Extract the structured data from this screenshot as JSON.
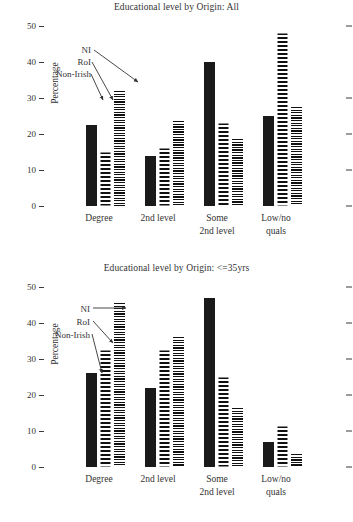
{
  "chart_data": [
    {
      "type": "bar",
      "title": "Educational level by Origin: All",
      "xlabel": "",
      "ylabel": "Percentage",
      "ylim": [
        0,
        50
      ],
      "yticks": [
        0,
        10,
        20,
        30,
        40,
        50
      ],
      "grid": false,
      "legend_position": "annotated-arrows",
      "categories": [
        "Degree",
        "2nd level",
        "Some\n2nd level",
        "Low/no\nquals"
      ],
      "category_lines": [
        [
          "Degree"
        ],
        [
          "2nd level"
        ],
        [
          "Some",
          "2nd level"
        ],
        [
          "Low/no",
          "quals"
        ]
      ],
      "series": [
        {
          "name": "NI",
          "pattern": "solid-black",
          "values": [
            22.5,
            14.0,
            40.0,
            25.0
          ]
        },
        {
          "name": "RoI",
          "pattern": "coarse-horizontal-stripes",
          "values": [
            15.0,
            16.0,
            23.0,
            48.0
          ]
        },
        {
          "name": "Non-Irish",
          "pattern": "fine-horizontal-stripes",
          "values": [
            32.0,
            23.5,
            18.5,
            27.5
          ]
        }
      ],
      "annotations": [
        {
          "label": "NI",
          "points_to_series": "NI"
        },
        {
          "label": "RoI",
          "points_to_series": "RoI"
        },
        {
          "label": "Non-Irish",
          "points_to_series": "Non-Irish"
        }
      ]
    },
    {
      "type": "bar",
      "title": "Educational level by Origin: <=35yrs",
      "xlabel": "",
      "ylabel": "Percentage",
      "ylim": [
        0,
        50
      ],
      "yticks": [
        0,
        10,
        20,
        30,
        40,
        50
      ],
      "grid": false,
      "legend_position": "annotated-arrows",
      "categories": [
        "Degree",
        "2nd level",
        "Some\n2nd level",
        "Low/no\nquals"
      ],
      "category_lines": [
        [
          "Degree"
        ],
        [
          "2nd level"
        ],
        [
          "Some",
          "2nd level"
        ],
        [
          "Low/no",
          "quals"
        ]
      ],
      "series": [
        {
          "name": "NI",
          "pattern": "solid-black",
          "values": [
            26.0,
            22.0,
            47.0,
            7.0
          ]
        },
        {
          "name": "RoI",
          "pattern": "coarse-horizontal-stripes",
          "values": [
            32.5,
            32.5,
            25.0,
            11.5
          ]
        },
        {
          "name": "Non-Irish",
          "pattern": "fine-horizontal-stripes",
          "values": [
            45.5,
            36.0,
            16.5,
            3.5
          ]
        }
      ],
      "annotations": [
        {
          "label": "NI",
          "points_to_series": "Non-Irish"
        },
        {
          "label": "RoI",
          "points_to_series": "RoI"
        },
        {
          "label": "Non-Irish",
          "points_to_series": "NI"
        }
      ]
    }
  ],
  "charts": [
    {
      "title": "Educational level by Origin: All",
      "ylabel": "Percentage",
      "yticks": [
        "50",
        "40",
        "30",
        "20",
        "10",
        "0"
      ],
      "xlabels": [
        {
          "line1": "Degree",
          "line2": ""
        },
        {
          "line1": "2nd level",
          "line2": ""
        },
        {
          "line1": "Some",
          "line2": "2nd level"
        },
        {
          "line1": "Low/no",
          "line2": "quals"
        }
      ],
      "callouts": {
        "ni": "NI",
        "roi": "RoI",
        "nonirish": "Non-Irish"
      }
    },
    {
      "title": "Educational level by Origin: <=35yrs",
      "ylabel": "Percentage",
      "yticks": [
        "50",
        "40",
        "30",
        "20",
        "10",
        "0"
      ],
      "xlabels": [
        {
          "line1": "Degree",
          "line2": ""
        },
        {
          "line1": "2nd level",
          "line2": ""
        },
        {
          "line1": "Some",
          "line2": "2nd level"
        },
        {
          "line1": "Low/no",
          "line2": "quals"
        }
      ],
      "callouts": {
        "ni": "NI",
        "roi": "RoI",
        "nonirish": "Non-Irish"
      }
    }
  ],
  "caption": ""
}
